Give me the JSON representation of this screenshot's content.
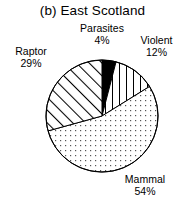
{
  "chart_data": {
    "type": "pie",
    "title": "(b) East Scotland",
    "xlabel": "",
    "ylabel": "",
    "grid": false,
    "legend": "none",
    "labels_position": "outside",
    "start_angle_deg": 90,
    "direction": "clockwise",
    "categories": [
      "Parasites",
      "Violent",
      "Mammal",
      "Raptor"
    ],
    "values": [
      4,
      12,
      54,
      29
    ],
    "value_unit": "%",
    "slices": [
      {
        "name": "Parasites",
        "value": 4,
        "label": "Parasites",
        "value_label": "4%",
        "fill": "solid-black",
        "color": "#000000"
      },
      {
        "name": "Violent",
        "value": 12,
        "label": "Violent",
        "value_label": "12%",
        "fill": "vertical-lines",
        "color": "#ffffff"
      },
      {
        "name": "Mammal",
        "value": 54,
        "label": "Mammal",
        "value_label": "54%",
        "fill": "dotted",
        "color": "#ffffff"
      },
      {
        "name": "Raptor",
        "value": 29,
        "label": "Raptor",
        "value_label": "29%",
        "fill": "diagonal-lines",
        "color": "#ffffff"
      }
    ],
    "geometry": {
      "center_x": 102,
      "center_y": 116,
      "radius": 56
    },
    "colors": {
      "stroke": "#000000",
      "background": "#ffffff"
    }
  }
}
